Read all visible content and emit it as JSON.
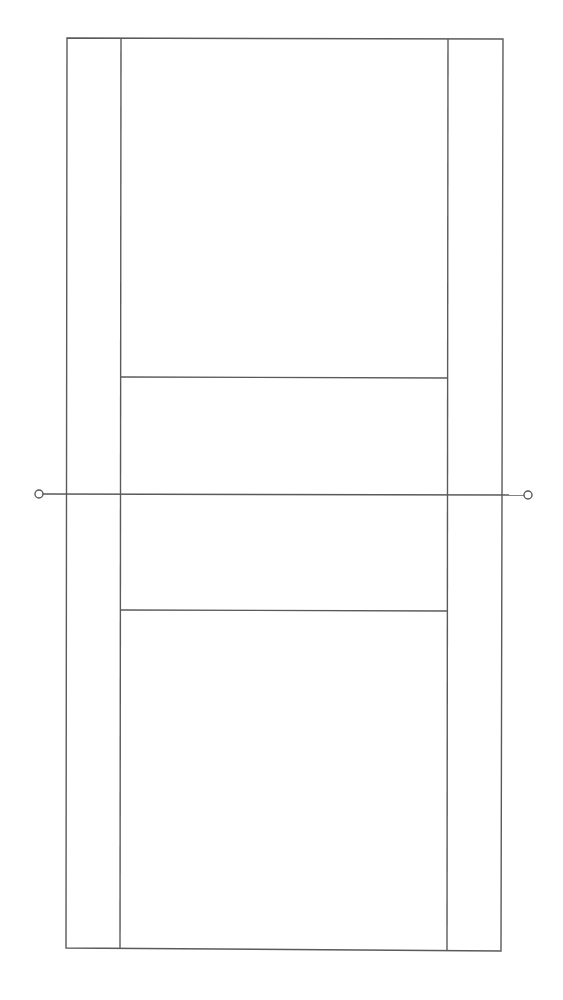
{
  "diagram": {
    "type": "court-layout",
    "colors": {
      "background": "#ffffff",
      "line": "#5a5a5a"
    },
    "court": {
      "outer": {
        "top_left": [
          67,
          38
        ],
        "top_right": [
          503,
          39
        ],
        "bottom_right": [
          501,
          951
        ],
        "bottom_left": [
          66,
          948
        ]
      },
      "singles_left": {
        "top": [
          121,
          38
        ],
        "bottom": [
          120,
          949
        ]
      },
      "singles_right": {
        "top": [
          448,
          39
        ],
        "bottom": [
          447,
          951
        ]
      },
      "service_line_top": {
        "left": [
          121,
          377
        ],
        "right": [
          448,
          378
        ]
      },
      "service_line_bottom": {
        "left": [
          120,
          610
        ],
        "right": [
          447,
          611
        ]
      },
      "net": {
        "left": [
          39,
          494
        ],
        "right": [
          528,
          495
        ]
      },
      "net_posts": [
        {
          "name": "left-net-post",
          "cx": 39,
          "cy": 494,
          "r": 4
        },
        {
          "name": "right-net-post",
          "cx": 528,
          "cy": 495,
          "r": 4
        }
      ]
    }
  }
}
